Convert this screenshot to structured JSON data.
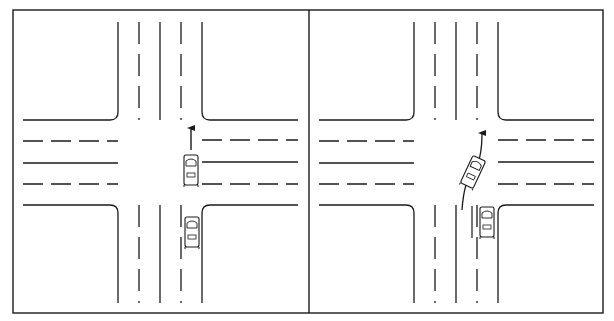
{
  "figure": {
    "panels": [
      {
        "id": "left",
        "label": "Car goes straight through intersection",
        "ink": "#111111"
      },
      {
        "id": "right",
        "label": "Car swerves left around stopped car",
        "ink": "#111111"
      }
    ],
    "colors": {
      "background": "#ffffff",
      "ink": "#1a1a1a"
    }
  }
}
